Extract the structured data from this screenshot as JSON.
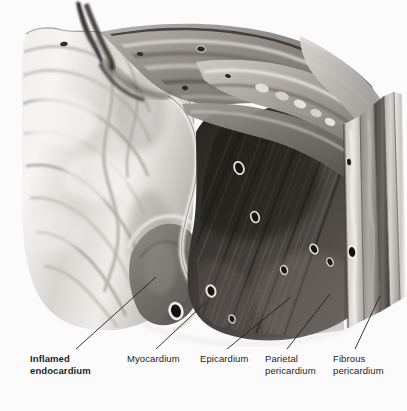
{
  "figure": {
    "background_color": "#fbfbfc",
    "line_color": "#231f20",
    "width": 407,
    "height": 411
  },
  "labels": [
    {
      "id": "inflamed-endocardium",
      "line1": "Inflamed",
      "line2": "endocardium",
      "bold": true,
      "text_x": 30,
      "text_y": 353,
      "leader": {
        "x1": 76,
        "y1": 349,
        "x2": 156,
        "y2": 277
      }
    },
    {
      "id": "myocardium",
      "line1": "Myocardium",
      "line2": "",
      "bold": false,
      "text_x": 127,
      "text_y": 353,
      "leader": {
        "x1": 156,
        "y1": 349,
        "x2": 205,
        "y2": 303
      }
    },
    {
      "id": "epicardium",
      "line1": "Epicardium",
      "line2": "",
      "bold": false,
      "text_x": 200,
      "text_y": 353,
      "leader": {
        "x1": 227,
        "y1": 349,
        "x2": 291,
        "y2": 297
      }
    },
    {
      "id": "parietal-pericardium",
      "line1": "Parietal",
      "line2": "pericardium",
      "bold": false,
      "text_x": 265,
      "text_y": 353,
      "leader": {
        "x1": 287,
        "y1": 349,
        "x2": 330,
        "y2": 294
      }
    },
    {
      "id": "fibrous-pericardium",
      "line1": "Fibrous",
      "line2": "pericardium",
      "bold": false,
      "text_x": 333,
      "text_y": 353,
      "leader": {
        "x1": 355,
        "y1": 349,
        "x2": 380,
        "y2": 296
      }
    }
  ],
  "anatomy": {
    "layers": [
      {
        "name": "endocardium-inflamed",
        "tone": "#8c8a88"
      },
      {
        "name": "myocardium",
        "tone": "#3a3734"
      },
      {
        "name": "epicardium",
        "tone": "#b9b6b2"
      },
      {
        "name": "parietal-pericardium",
        "tone": "#6e6b67"
      },
      {
        "name": "fibrous-pericardium",
        "tone": "#9d9a96"
      }
    ]
  }
}
